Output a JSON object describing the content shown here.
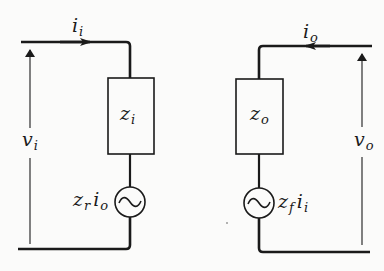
{
  "diagram": {
    "type": "two-port equivalent circuit",
    "input_side": {
      "current": {
        "symbol": "i",
        "subscript": "i"
      },
      "voltage": {
        "symbol": "v",
        "subscript": "i"
      },
      "impedance": {
        "symbol": "z",
        "subscript": "i"
      },
      "source": {
        "symbol": "z",
        "subscript": "r",
        "symbol2": "i",
        "subscript2": "o",
        "glyph": "~"
      }
    },
    "output_side": {
      "current": {
        "symbol": "i",
        "subscript": "o"
      },
      "voltage": {
        "symbol": "v",
        "subscript": "o"
      },
      "impedance": {
        "symbol": "z",
        "subscript": "o"
      },
      "source": {
        "symbol": "z",
        "subscript": "f",
        "symbol2": "i",
        "subscript2": "i",
        "glyph": "~"
      }
    },
    "colors": {
      "line": "#1a1a1a",
      "background": "#fbfbfa"
    }
  }
}
